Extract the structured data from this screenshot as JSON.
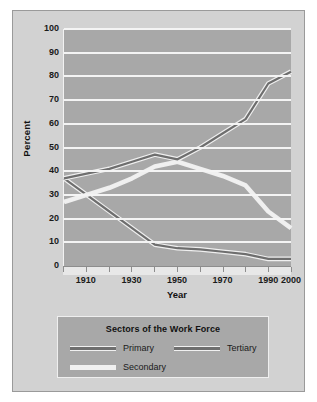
{
  "chart_data": {
    "type": "line",
    "title": "",
    "xlabel": "Year",
    "ylabel": "Percent",
    "xlim": [
      1900,
      2000
    ],
    "ylim": [
      0,
      100
    ],
    "grid": true,
    "legend_position": "below",
    "legend_title": "Sectors of the Work Force",
    "x_ticks": [
      1910,
      1930,
      1950,
      1970,
      1990,
      2000
    ],
    "y_ticks": [
      0,
      10,
      20,
      30,
      40,
      50,
      60,
      70,
      80,
      90,
      100
    ],
    "x": [
      1900,
      1910,
      1920,
      1930,
      1940,
      1950,
      1960,
      1970,
      1980,
      1990,
      2000
    ],
    "series": [
      {
        "name": "Primary",
        "color": "#6e6e6e",
        "values": [
          37,
          30,
          23,
          16,
          9,
          7.5,
          7,
          6,
          5,
          3,
          3
        ]
      },
      {
        "name": "Secondary",
        "color": "#f0f0f0",
        "values": [
          27,
          30,
          33,
          37,
          42,
          44,
          41,
          38,
          34,
          23,
          16
        ]
      },
      {
        "name": "Tertiary",
        "color": "#6e6e6e",
        "values": [
          37,
          39,
          41,
          44,
          47,
          45,
          50,
          56,
          62,
          77,
          82
        ]
      }
    ]
  },
  "axes": {
    "y_title": "Percent",
    "x_title": "Year",
    "y_tick_labels": [
      "100",
      "90",
      "80",
      "70",
      "60",
      "50",
      "40",
      "30",
      "20",
      "10",
      "0"
    ],
    "x_tick_labels": [
      "1910",
      "1930",
      "1950",
      "1970",
      "1990",
      "2000"
    ]
  },
  "legend": {
    "title": "Sectors of the Work Force",
    "entries": [
      {
        "label": "Primary",
        "color": "#6e6e6e"
      },
      {
        "label": "Tertiary",
        "color": "#6e6e6e"
      },
      {
        "label": "Secondary",
        "color": "#f0f0f0"
      }
    ]
  }
}
